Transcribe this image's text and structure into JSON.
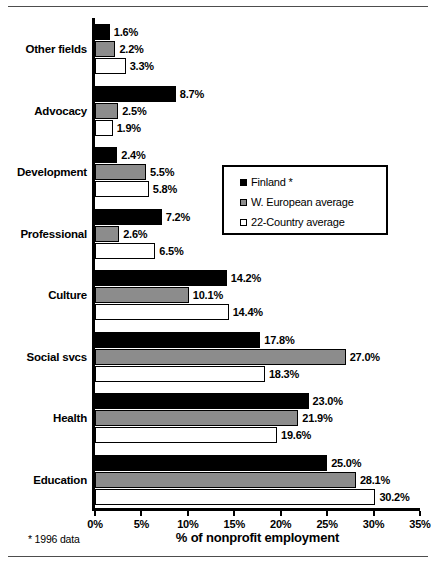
{
  "chart_data": {
    "type": "bar",
    "orientation": "horizontal",
    "title": "",
    "xlabel": "% of nonprofit employment",
    "ylabel": "",
    "xlim": [
      0,
      35
    ],
    "xticks": [
      "0%",
      "5%",
      "10%",
      "15%",
      "20%",
      "25%",
      "30%",
      "35%"
    ],
    "xtick_values": [
      0,
      5,
      10,
      15,
      20,
      25,
      30,
      35
    ],
    "grid": false,
    "legend_position": "center-right",
    "categories": [
      "Other fields",
      "Advocacy",
      "Development",
      "Professional",
      "Culture",
      "Social svcs",
      "Health",
      "Education"
    ],
    "series": [
      {
        "name": "Finland *",
        "color": "#000000",
        "values": [
          1.6,
          8.7,
          2.4,
          7.2,
          14.2,
          17.8,
          23.0,
          25.0
        ],
        "labels": [
          "1.6%",
          "8.7%",
          "2.4%",
          "7.2%",
          "14.2%",
          "17.8%",
          "23.0%",
          "25.0%"
        ]
      },
      {
        "name": "W. European average",
        "color": "#8c8c8c",
        "values": [
          2.2,
          2.5,
          5.5,
          2.6,
          10.1,
          27.0,
          21.9,
          28.1
        ],
        "labels": [
          "2.2%",
          "2.5%",
          "5.5%",
          "2.6%",
          "10.1%",
          "27.0%",
          "21.9%",
          "28.1%"
        ]
      },
      {
        "name": "22-Country average",
        "color": "#ffffff",
        "values": [
          3.3,
          1.9,
          5.8,
          6.5,
          14.4,
          18.3,
          19.6,
          30.2
        ],
        "labels": [
          "3.3%",
          "1.9%",
          "5.8%",
          "6.5%",
          "14.4%",
          "18.3%",
          "19.6%",
          "30.2%"
        ]
      }
    ],
    "footnote": "* 1996 data"
  },
  "legend": {
    "items": [
      {
        "label": "Finland *"
      },
      {
        "label": "W. European average"
      },
      {
        "label": "22-Country average"
      }
    ]
  }
}
